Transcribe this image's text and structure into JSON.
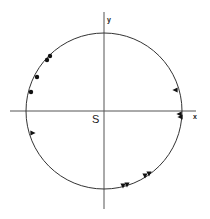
{
  "diagram": {
    "type": "stereonet-projection",
    "center": {
      "x": 104,
      "y": 111
    },
    "radius": 78,
    "colors": {
      "line": "#333333",
      "axis": "#555555",
      "marker": "#111111",
      "background": "#ffffff"
    },
    "axes": {
      "x_label": "x",
      "y_label": "y",
      "origin_label": "S"
    },
    "markers": {
      "dots": [
        {
          "x": 50,
          "y": 56
        },
        {
          "x": 47,
          "y": 60
        },
        {
          "x": 37,
          "y": 77
        },
        {
          "x": 31,
          "y": 92
        }
      ],
      "triangles": [
        {
          "x": 175,
          "y": 90,
          "dir": "left"
        },
        {
          "x": 33,
          "y": 133,
          "dir": "right"
        },
        {
          "x": 179,
          "y": 114,
          "dir": "left"
        },
        {
          "x": 180,
          "y": 117,
          "dir": "left"
        },
        {
          "x": 123,
          "y": 186,
          "dir": "up"
        },
        {
          "x": 127,
          "y": 185,
          "dir": "up"
        },
        {
          "x": 145,
          "y": 176,
          "dir": "up"
        },
        {
          "x": 149,
          "y": 174,
          "dir": "up"
        }
      ]
    }
  }
}
